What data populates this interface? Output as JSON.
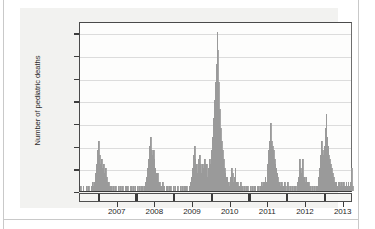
{
  "figure": {
    "background_color": "#f2f2f0",
    "plot_background_color": "#fdfdfc",
    "bar_color": "#a8a8a8",
    "grid_color": "#dcdcdc",
    "axis_color": "#3a3a3a"
  },
  "chart_data": {
    "type": "bar",
    "title": "",
    "subtitle": "",
    "xlabel": "",
    "ylabel": "Number of pediatric deaths",
    "ylim": [
      0,
      37.5
    ],
    "yticks": [
      0,
      5,
      10,
      15,
      20,
      25,
      30,
      35
    ],
    "ytick_labels": [
      "0",
      "5",
      "10",
      "15",
      "20",
      "25",
      "30",
      "35"
    ],
    "xlim": [
      "2006-07",
      "2013-09"
    ],
    "xtick_labels": [
      "2007",
      "2008",
      "2009",
      "2010",
      "2011",
      "2012",
      "2013"
    ],
    "grid": "horizontal",
    "legend": "none",
    "annotations": [],
    "series_name": "Weekly pediatric influenza-associated deaths",
    "x_note": "Weekly bars spanning mid-2006 through late 2013; year tick marks delimit calendar years",
    "values": [
      1,
      0,
      0,
      1,
      0,
      0,
      0,
      1,
      0,
      1,
      0,
      0,
      1,
      2,
      1,
      2,
      3,
      4,
      6,
      9,
      11,
      8,
      6,
      7,
      5,
      6,
      4,
      3,
      5,
      3,
      2,
      2,
      1,
      1,
      1,
      0,
      1,
      0,
      1,
      1,
      0,
      0,
      1,
      0,
      1,
      0,
      1,
      0,
      0,
      1,
      0,
      1,
      1,
      0,
      0,
      1,
      1,
      0,
      1,
      0,
      1,
      0,
      0,
      1,
      0,
      1,
      0,
      1,
      1,
      0,
      1,
      2,
      2,
      3,
      5,
      7,
      10,
      12,
      9,
      8,
      9,
      7,
      5,
      4,
      3,
      4,
      2,
      2,
      1,
      1,
      2,
      1,
      1,
      0,
      1,
      0,
      1,
      0,
      1,
      1,
      0,
      0,
      1,
      0,
      1,
      0,
      0,
      1,
      0,
      0,
      1,
      0,
      1,
      0,
      1,
      1,
      0,
      1,
      0,
      0,
      1,
      2,
      3,
      5,
      8,
      10,
      7,
      5,
      6,
      4,
      7,
      8,
      6,
      4,
      6,
      5,
      7,
      6,
      4,
      6,
      3,
      5,
      7,
      6,
      9,
      12,
      16,
      20,
      24,
      28,
      35,
      31,
      24,
      18,
      14,
      11,
      9,
      7,
      5,
      4,
      3,
      3,
      2,
      2,
      1,
      3,
      5,
      4,
      2,
      3,
      5,
      2,
      1,
      2,
      1,
      1,
      2,
      1,
      1,
      0,
      1,
      0,
      1,
      0,
      1,
      0,
      0,
      1,
      0,
      1,
      0,
      1,
      1,
      0,
      1,
      0,
      1,
      0,
      1,
      2,
      1,
      2,
      2,
      3,
      2,
      4,
      6,
      9,
      11,
      15,
      11,
      10,
      9,
      7,
      6,
      5,
      4,
      3,
      2,
      2,
      1,
      2,
      1,
      1,
      2,
      1,
      0,
      1,
      2,
      1,
      0,
      1,
      0,
      1,
      0,
      1,
      1,
      0,
      1,
      2,
      3,
      7,
      5,
      4,
      7,
      3,
      3,
      2,
      3,
      2,
      1,
      2,
      1,
      1,
      0,
      1,
      0,
      1,
      0,
      1,
      1,
      2,
      3,
      5,
      8,
      11,
      9,
      8,
      10,
      14,
      17,
      12,
      10,
      8,
      7,
      6,
      5,
      4,
      3,
      2,
      2,
      2,
      1,
      2,
      1,
      2,
      1,
      2,
      1,
      2,
      1,
      1,
      2,
      1,
      2,
      1,
      1,
      2,
      5,
      1
    ],
    "peak_value": 35,
    "peak_period": "2009 pandemic season",
    "seasonal_peaks": [
      {
        "season": "2006-2007",
        "peak": 11
      },
      {
        "season": "2007-2008",
        "peak": 12
      },
      {
        "season": "2008-2009",
        "peak": 10
      },
      {
        "season": "2009 pandemic",
        "peak": 35
      },
      {
        "season": "2010-2011",
        "peak": 15
      },
      {
        "season": "2011-2012",
        "peak": 7
      },
      {
        "season": "2012-2013",
        "peak": 17
      }
    ]
  }
}
